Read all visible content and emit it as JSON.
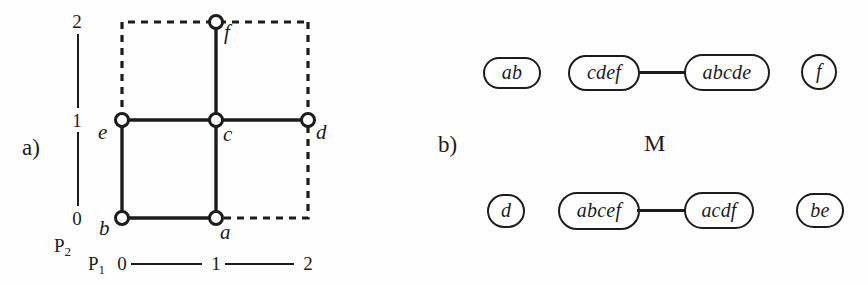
{
  "figure": {
    "background_color": "#fefefe",
    "ink_color": "#1c1c1c",
    "width": 868,
    "height": 285
  },
  "panel_a": {
    "label": "a)",
    "axes": {
      "y_axis_name": "P",
      "y_axis_sub": "2",
      "x_axis_name": "P",
      "x_axis_sub": "1",
      "y_ticks": [
        "2",
        "1",
        "0"
      ],
      "x_ticks": [
        "0",
        "1",
        "2"
      ]
    },
    "graph": {
      "nodes": [
        {
          "id": "b",
          "label": "b",
          "x": 0,
          "y": 0
        },
        {
          "id": "a",
          "label": "a",
          "x": 1,
          "y": 0
        },
        {
          "id": "e",
          "label": "e",
          "x": 0,
          "y": 1
        },
        {
          "id": "c",
          "label": "c",
          "x": 1,
          "y": 1
        },
        {
          "id": "d",
          "label": "d",
          "x": 2,
          "y": 1
        },
        {
          "id": "f",
          "label": "f",
          "x": 1,
          "y": 2
        }
      ],
      "solid_edges": [
        [
          "b",
          "a"
        ],
        [
          "b",
          "e"
        ],
        [
          "e",
          "c"
        ],
        [
          "a",
          "c"
        ],
        [
          "c",
          "d"
        ],
        [
          "c",
          "f"
        ]
      ],
      "dashed_boundary": [
        [
          "e",
          "top-left-corner"
        ],
        [
          "top-left-corner",
          "f"
        ],
        [
          "f",
          "top-right-corner"
        ],
        [
          "top-right-corner",
          "d"
        ],
        [
          "d",
          "bottom-right-corner"
        ],
        [
          "bottom-right-corner",
          "a"
        ]
      ]
    }
  },
  "panel_b": {
    "label": "b)",
    "title": "M",
    "rows": [
      {
        "row_id": "top",
        "nodes": [
          {
            "id": "ab",
            "label": "ab",
            "connected": false
          },
          {
            "id": "cdef",
            "label": "cdef",
            "connected": true
          },
          {
            "id": "abcde",
            "label": "abcde",
            "connected": true
          },
          {
            "id": "f",
            "label": "f",
            "connected": false
          }
        ],
        "edges": [
          [
            "cdef",
            "abcde"
          ]
        ]
      },
      {
        "row_id": "bottom",
        "nodes": [
          {
            "id": "d",
            "label": "d",
            "connected": false
          },
          {
            "id": "abcef",
            "label": "abcef",
            "connected": true
          },
          {
            "id": "acdf",
            "label": "acdf",
            "connected": true
          },
          {
            "id": "be",
            "label": "be",
            "connected": false
          }
        ],
        "edges": [
          [
            "abcef",
            "acdf"
          ]
        ]
      }
    ]
  }
}
